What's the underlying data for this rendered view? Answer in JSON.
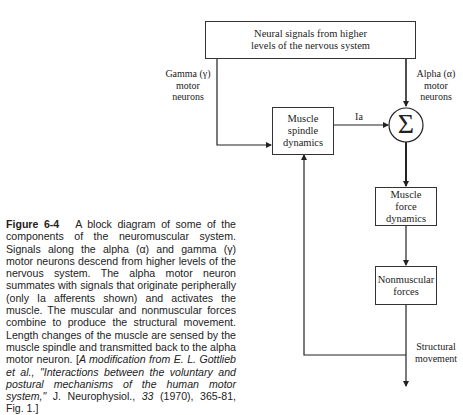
{
  "diagram": {
    "top_box": {
      "line1": "Neural signals from higher",
      "line2": "levels of the nervous system"
    },
    "gamma_label": {
      "line1": "Gamma (γ)",
      "line2": "motor",
      "line3": "neurons"
    },
    "alpha_label": {
      "line1": "Alpha (α)",
      "line2": "motor",
      "line3": "neurons"
    },
    "spindle_box": {
      "line1": "Muscle",
      "line2": "spindle",
      "line3": "dynamics"
    },
    "ia_label": "Ia",
    "sum_symbol": "Σ",
    "muscle_force_box": {
      "line1": "Muscle",
      "line2": "force",
      "line3": "dynamics"
    },
    "nonmuscular_box": {
      "line1": "Nonmuscular",
      "line2": "forces"
    },
    "structural_label": {
      "line1": "Structural",
      "line2": "movement"
    }
  },
  "caption": {
    "figure_label": "Figure 6-4",
    "body": "A block diagram of some of the components of the neuromuscular system. Signals along the alpha (α) and gamma (γ) motor neurons descend from higher levels of the nervous system. The alpha motor neuron summates with signals that originate peripherally (only Ia afferents shown) and activates the muscle. The muscular and nonmuscular forces combine to produce the structural movement. Length changes of the muscle are sensed by the muscle spindle and transmitted back to the alpha motor neuron. [",
    "citation_italic_1": "A modification from E. L. Gottlieb et al., \"Interactions between the voluntary and postural mechanisms of the human motor system,\"",
    "journal": " J. Neurophysiol., ",
    "volume_italic": "33",
    "citation_tail": " (1970), 365-81, Fig. 1.]"
  }
}
